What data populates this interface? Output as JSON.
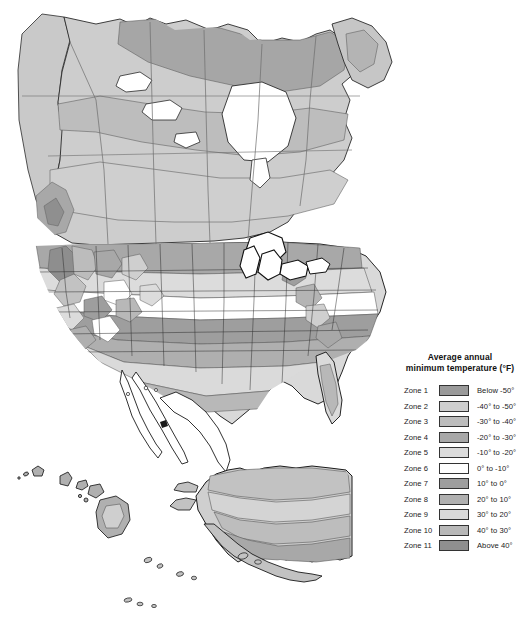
{
  "map": {
    "title": "Plant hardiness zone map of North America",
    "background_color": "#ffffff",
    "outline_color": "#1a1a1a",
    "border_color": "#555555",
    "water_color": "#ffffff",
    "unfilled_color": "#ffffff",
    "regions": [
      {
        "name": "canada-mainland",
        "label": "Canada"
      },
      {
        "name": "united-states-mainland",
        "label": "United States"
      },
      {
        "name": "mexico-outline",
        "label": "Mexico"
      },
      {
        "name": "alaska-inset",
        "label": "Alaska"
      },
      {
        "name": "hawaii-inset",
        "label": "Hawaii"
      },
      {
        "name": "great-lakes",
        "label": "Great Lakes"
      },
      {
        "name": "greenland-fragment",
        "label": "Greenland"
      }
    ]
  },
  "legend": {
    "title_line_1": "Average annual",
    "title_line_2": "minimum temperature (°F)",
    "title": "Average annual minimum temperature (°F)",
    "rows": [
      {
        "zone": "Zone 1",
        "range": "Below -50°",
        "color": "#9a9a9a"
      },
      {
        "zone": "Zone 2",
        "range": "-40° to -50°",
        "color": "#cfcfcf"
      },
      {
        "zone": "Zone 3",
        "range": "-30° to -40°",
        "color": "#bdbdbd"
      },
      {
        "zone": "Zone 4",
        "range": "-20° to -30°",
        "color": "#a8a8a8"
      },
      {
        "zone": "Zone 5",
        "range": "-10° to -20°",
        "color": "#dcdcdc"
      },
      {
        "zone": "Zone 6",
        "range": "0° to -10°",
        "color": "#ffffff"
      },
      {
        "zone": "Zone 7",
        "range": "10° to 0°",
        "color": "#9e9e9e"
      },
      {
        "zone": "Zone 8",
        "range": "20° to 10°",
        "color": "#b0b0b0"
      },
      {
        "zone": "Zone 9",
        "range": "30° to 20°",
        "color": "#dadada"
      },
      {
        "zone": "Zone 10",
        "range": "40° to 30°",
        "color": "#b8b8b8"
      },
      {
        "zone": "Zone 11",
        "range": "Above 40°",
        "color": "#8f8f8f"
      }
    ]
  }
}
